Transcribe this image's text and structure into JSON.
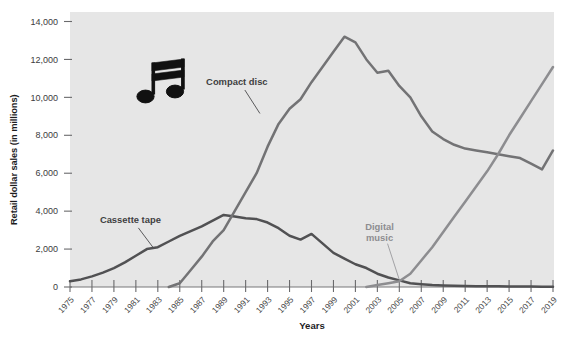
{
  "chart_data": {
    "type": "line",
    "title": "",
    "xlabel": "Years",
    "ylabel": "Retail dollar sales (in millions)",
    "xlim": [
      1975,
      2019
    ],
    "ylim": [
      0,
      14000
    ],
    "grid": false,
    "legend": "inline-labels",
    "x": [
      1975,
      1976,
      1977,
      1978,
      1979,
      1980,
      1981,
      1982,
      1983,
      1984,
      1985,
      1986,
      1987,
      1988,
      1989,
      1990,
      1991,
      1992,
      1993,
      1994,
      1995,
      1996,
      1997,
      1998,
      1999,
      2000,
      2001,
      2002,
      2003,
      2004,
      2005,
      2006,
      2007,
      2008,
      2009,
      2010,
      2011,
      2012,
      2013,
      2014,
      2015,
      2016,
      2017,
      2018,
      2019
    ],
    "x_tick_labels": [
      "1975",
      "1977",
      "1979",
      "1981",
      "1983",
      "1985",
      "1987",
      "1989",
      "1991",
      "1993",
      "1995",
      "1997",
      "1999",
      "2001",
      "2003",
      "2005",
      "2007",
      "2009",
      "2011",
      "2013",
      "2015",
      "2017",
      "2019"
    ],
    "y_tick_labels": [
      "0",
      "2,000",
      "4,000",
      "6,000",
      "8,000",
      "10,000",
      "12,000",
      "14,000"
    ],
    "y_tick_values": [
      0,
      2000,
      4000,
      6000,
      8000,
      10000,
      12000,
      14000
    ],
    "series": [
      {
        "name": "Cassette tape",
        "color": "#515153",
        "label_color": "#3f3f41",
        "label_x": 1980.4,
        "label_y": 3400,
        "values": [
          300,
          400,
          560,
          760,
          1000,
          1300,
          1650,
          2000,
          2100,
          2400,
          2700,
          2950,
          3200,
          3500,
          3800,
          3720,
          3620,
          3580,
          3400,
          3100,
          2700,
          2500,
          2800,
          2300,
          1800,
          1500,
          1200,
          1000,
          700,
          500,
          350,
          200,
          150,
          100,
          80,
          60,
          50,
          45,
          40,
          35,
          30,
          25,
          20,
          18,
          15
        ]
      },
      {
        "name": "Compact disc",
        "color": "#737375",
        "label_color": "#3f3f41",
        "label_x": 1990.2,
        "label_y": 10600,
        "values": [
          0,
          0,
          0,
          0,
          0,
          0,
          0,
          0,
          0,
          0,
          200,
          900,
          1600,
          2400,
          3000,
          4000,
          5000,
          6000,
          7400,
          8600,
          9400,
          9900,
          10800,
          11600,
          12400,
          13200,
          12900,
          12000,
          11300,
          11400,
          10600,
          10000,
          9000,
          8200,
          7800,
          7500,
          7300,
          7200,
          7100,
          7000,
          6900,
          6800,
          6500,
          6200,
          7200
        ]
      },
      {
        "name": "Digital music",
        "color": "#8d8d90",
        "label_color": "#8d8d90",
        "label_x": 2003.0,
        "label_y": 2450,
        "values": [
          0,
          0,
          0,
          0,
          0,
          0,
          0,
          0,
          0,
          0,
          0,
          0,
          0,
          0,
          0,
          0,
          0,
          0,
          0,
          0,
          0,
          0,
          0,
          0,
          0,
          0,
          0,
          0,
          100,
          200,
          300,
          700,
          1400,
          2100,
          2900,
          3700,
          4500,
          5300,
          6100,
          7000,
          8000,
          8900,
          9800,
          10700,
          11600
        ]
      }
    ],
    "annotations": [
      {
        "name": "music-note-icon",
        "x": 1981.5,
        "y": 10400
      }
    ],
    "plot_background": "#e6e6e6",
    "page_background": "#ffffff"
  }
}
